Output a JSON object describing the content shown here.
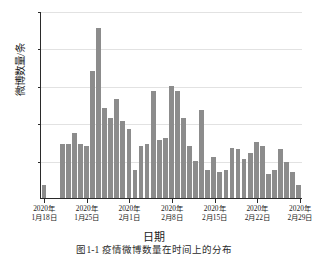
{
  "chart_data": {
    "type": "bar",
    "title": "",
    "caption": "图1-1  疫情微博数量在时间上的分布",
    "xlabel": "日期",
    "ylabel": "微博数量/条",
    "ylim": [
      0,
      100
    ],
    "yticks": [
      20,
      40,
      60,
      80,
      100
    ],
    "grid": true,
    "legend": false,
    "bar_color": "#8c8c8c",
    "axis_color": "#2a2a2a",
    "x_tick_labels": [
      {
        "line1": "2020年",
        "line2": "1月18日"
      },
      {
        "line1": "2020年",
        "line2": "1月25日"
      },
      {
        "line1": "2020年",
        "line2": "2月1日"
      },
      {
        "line1": "2020年",
        "line2": "2月8日"
      },
      {
        "line1": "2020年",
        "line2": "2月15日"
      },
      {
        "line1": "2020年",
        "line2": "2月22日"
      },
      {
        "line1": "2020年",
        "line2": "2月29日"
      }
    ],
    "x_tick_indices": [
      0,
      7,
      14,
      21,
      28,
      35,
      42
    ],
    "categories": [
      "2020-01-18",
      "2020-01-19",
      "2020-01-20",
      "2020-01-21",
      "2020-01-22",
      "2020-01-23",
      "2020-01-24",
      "2020-01-25",
      "2020-01-26",
      "2020-01-27",
      "2020-01-28",
      "2020-01-29",
      "2020-01-30",
      "2020-01-31",
      "2020-02-01",
      "2020-02-02",
      "2020-02-03",
      "2020-02-04",
      "2020-02-05",
      "2020-02-06",
      "2020-02-07",
      "2020-02-08",
      "2020-02-09",
      "2020-02-10",
      "2020-02-11",
      "2020-02-12",
      "2020-02-13",
      "2020-02-14",
      "2020-02-15",
      "2020-02-16",
      "2020-02-17",
      "2020-02-18",
      "2020-02-19",
      "2020-02-20",
      "2020-02-21",
      "2020-02-22",
      "2020-02-23",
      "2020-02-24",
      "2020-02-25",
      "2020-02-26",
      "2020-02-27",
      "2020-02-28",
      "2020-02-29"
    ],
    "values": [
      7,
      0,
      0,
      29,
      29,
      35,
      29,
      28,
      68,
      91,
      48,
      43,
      53,
      41,
      37,
      15,
      28,
      29,
      57,
      31,
      32,
      60,
      57,
      43,
      28,
      20,
      47,
      15,
      22,
      14,
      15,
      27,
      26,
      21,
      24,
      30,
      28,
      13,
      15,
      26,
      19,
      14,
      7
    ]
  }
}
